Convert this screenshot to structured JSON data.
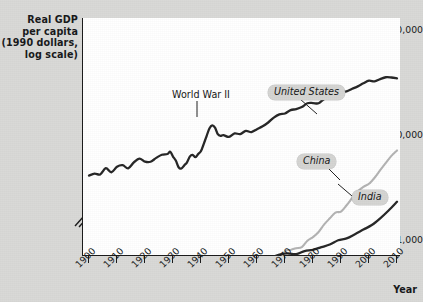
{
  "chart_data": {
    "type": "line",
    "title": "",
    "ylabel": "Real GDP per capita (1990 dollars, log scale)",
    "ylabel_lines": [
      "Real GDP",
      "per capita",
      "(1990 dollars,",
      "log scale)"
    ],
    "xlabel": "Year",
    "yscale": "log",
    "yticks": [
      1000,
      10000,
      100000
    ],
    "ytick_labels": [
      "1,000",
      "10,000",
      "$100,000"
    ],
    "ylim": [
      700,
      130000
    ],
    "y_axis_break": true,
    "xticks": [
      1900,
      1910,
      1920,
      1930,
      1940,
      1950,
      1960,
      1970,
      1980,
      1990,
      2000,
      2010
    ],
    "xtick_labels": [
      "1900",
      "1910",
      "1920",
      "1930",
      "1940",
      "1950",
      "1960",
      "1970",
      "1980",
      "1990",
      "2000",
      "2010"
    ],
    "xlim": [
      1900,
      2010
    ],
    "grid": false,
    "legend": "inline-labels",
    "annotations": [
      {
        "text": "World War II",
        "x": 1944,
        "y": 12000
      },
      {
        "text": "United States",
        "x": 1983,
        "y": 24000
      },
      {
        "text": "China",
        "x": 1991,
        "y": 2100
      },
      {
        "text": "India",
        "x": 2006,
        "y": 1300
      }
    ],
    "series": [
      {
        "name": "United States",
        "color": "#262626",
        "style": "solid",
        "x": [
          1900,
          1902,
          1904,
          1906,
          1908,
          1910,
          1912,
          1914,
          1916,
          1918,
          1920,
          1922,
          1924,
          1926,
          1928,
          1929,
          1930,
          1931,
          1932,
          1933,
          1934,
          1935,
          1936,
          1937,
          1938,
          1939,
          1940,
          1941,
          1942,
          1943,
          1944,
          1945,
          1946,
          1947,
          1948,
          1950,
          1952,
          1954,
          1956,
          1958,
          1960,
          1962,
          1964,
          1966,
          1968,
          1970,
          1972,
          1974,
          1976,
          1978,
          1980,
          1982,
          1984,
          1986,
          1988,
          1990,
          1992,
          1994,
          1996,
          1998,
          2000,
          2002,
          2004,
          2006,
          2008,
          2010
        ],
        "y": [
          4091,
          4270,
          4192,
          4808,
          4399,
          4964,
          5139,
          4799,
          5456,
          5942,
          5552,
          5540,
          6031,
          6466,
          6569,
          6899,
          6213,
          5691,
          4908,
          4777,
          5114,
          5467,
          6204,
          6430,
          6126,
          6561,
          7010,
          8206,
          9741,
          11518,
          12330,
          11709,
          10144,
          9767,
          9953,
          9561,
          10316,
          10164,
          10914,
          10636,
          11328,
          12065,
          13120,
          14600,
          15650,
          15990,
          17200,
          17600,
          18400,
          20000,
          20100,
          20000,
          22000,
          23000,
          24500,
          25500,
          26000,
          27500,
          29000,
          31000,
          32800,
          32300,
          34000,
          35400,
          35200,
          34600
        ]
      },
      {
        "name": "China",
        "color": "#b3b3b3",
        "style": "solid",
        "x": [
          1929,
          1931,
          1933,
          1935,
          1936,
          1938,
          1940,
          1942,
          1944,
          1946,
          1948,
          1950,
          1952,
          1954,
          1956,
          1958,
          1960,
          1962,
          1964,
          1966,
          1968,
          1970,
          1972,
          1974,
          1976,
          1978,
          1980,
          1982,
          1984,
          1986,
          1988,
          1990,
          1992,
          1994,
          1996,
          1998,
          2000,
          2002,
          2004,
          2006,
          2008,
          2010
        ],
        "y": [
          562,
          580,
          595,
          590,
          597,
          562,
          540,
          530,
          520,
          500,
          480,
          448,
          538,
          560,
          600,
          680,
          662,
          497,
          570,
          640,
          620,
          778,
          800,
          830,
          850,
          978,
          1061,
          1186,
          1400,
          1600,
          1816,
          1858,
          2132,
          2500,
          2900,
          3200,
          3421,
          3900,
          4600,
          5400,
          6300,
          7100
        ]
      },
      {
        "name": "India",
        "color": "#262626",
        "style": "solid",
        "x": [
          1900,
          1903,
          1906,
          1909,
          1912,
          1915,
          1918,
          1921,
          1924,
          1927,
          1929,
          1931,
          1933,
          1935,
          1937,
          1939,
          1941,
          1943,
          1945,
          1947,
          1950,
          1953,
          1956,
          1959,
          1962,
          1965,
          1968,
          1971,
          1974,
          1977,
          1980,
          1983,
          1986,
          1989,
          1992,
          1995,
          1998,
          2001,
          2004,
          2007,
          2010
        ],
        "y": [
          599,
          610,
          600,
          625,
          620,
          640,
          600,
          630,
          655,
          640,
          660,
          640,
          655,
          640,
          660,
          650,
          670,
          600,
          640,
          618,
          619,
          650,
          670,
          680,
          690,
          680,
          720,
          740,
          730,
          780,
          800,
          850,
          900,
          990,
          1030,
          1130,
          1250,
          1380,
          1600,
          1900,
          2300
        ]
      }
    ]
  }
}
